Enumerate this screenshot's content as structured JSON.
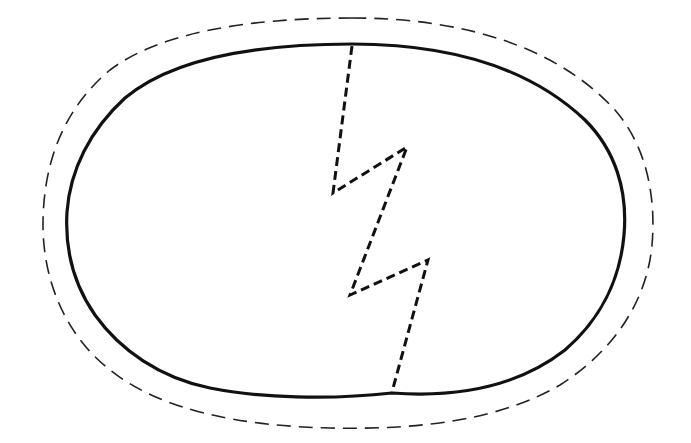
{
  "figure": {
    "colors": {
      "background": "#ffffff",
      "outline": "#111111",
      "crack": "#111111",
      "dashed_outline": "#222222"
    },
    "elements": [
      {
        "name": "egg-outline",
        "style": "solid"
      },
      {
        "name": "outer-dashed-outline",
        "style": "dashed"
      },
      {
        "name": "crack-line",
        "style": "dashed",
        "segments": 5
      }
    ]
  }
}
